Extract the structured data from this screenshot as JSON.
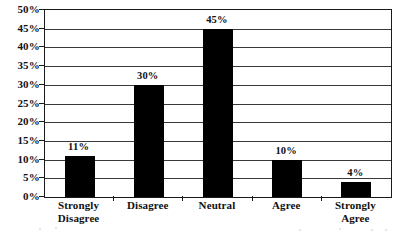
{
  "chart_data": {
    "type": "bar",
    "title": "",
    "subtitle": "",
    "xlabel": "",
    "ylabel": "",
    "categories": [
      "Strongly Disagree",
      "Disagree",
      "Neutral",
      "Agree",
      "Strongly Agree"
    ],
    "category_labels_wrapped": [
      "Strongly\nDisagree",
      "Disagree",
      "Neutral",
      "Agree",
      "Strongly\nAgree"
    ],
    "values": [
      11,
      30,
      45,
      10,
      4
    ],
    "data_labels": [
      "11%",
      "30%",
      "45%",
      "10%",
      "4%"
    ],
    "ylim": [
      0,
      50
    ],
    "ytick_values": [
      0,
      5,
      10,
      15,
      20,
      25,
      30,
      35,
      40,
      45,
      50
    ],
    "ytick_labels": [
      "0%",
      "5%",
      "10%",
      "15%",
      "20%",
      "25%",
      "30%",
      "35%",
      "40%",
      "45%",
      "50%"
    ],
    "grid": true,
    "grid_axis": "y",
    "legend": false,
    "legend_position": "none",
    "bar_color": "#000000",
    "grid_color": "#3a3a3a",
    "axis_color": "#1a1a1a",
    "text_color": "#111111"
  }
}
